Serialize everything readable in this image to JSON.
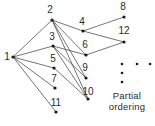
{
  "figure": {
    "caption": "Partial\nordering",
    "caption_x": 127,
    "caption_y": 90,
    "edge_color": "#3a3a3a",
    "node_color": "#1a1a1a",
    "label_color": "#2a2a2a",
    "background": "#ffffff"
  },
  "chart_data": {
    "type": "diagram",
    "title": "Partial ordering",
    "layout": "directed-acyclic-graph",
    "nodes": [
      {
        "id": "1",
        "label": "1",
        "x": 13,
        "y": 57,
        "label_x": 7,
        "label_y": 57
      },
      {
        "id": "2",
        "label": "2",
        "x": 52,
        "y": 20,
        "label_x": 50,
        "label_y": 10
      },
      {
        "id": "3",
        "label": "3",
        "x": 53,
        "y": 46,
        "label_x": 52,
        "label_y": 37
      },
      {
        "id": "4",
        "label": "4",
        "x": 83,
        "y": 31,
        "label_x": 82,
        "label_y": 22
      },
      {
        "id": "5",
        "label": "5",
        "x": 54,
        "y": 68,
        "label_x": 53,
        "label_y": 59
      },
      {
        "id": "6",
        "label": "6",
        "x": 86,
        "y": 55,
        "label_x": 85,
        "label_y": 45
      },
      {
        "id": "7",
        "label": "7",
        "x": 55,
        "y": 88,
        "label_x": 54,
        "label_y": 79
      },
      {
        "id": "8",
        "label": "8",
        "x": 124,
        "y": 17,
        "label_x": 123,
        "label_y": 7
      },
      {
        "id": "9",
        "label": "9",
        "x": 86,
        "y": 78,
        "label_x": 85,
        "label_y": 68
      },
      {
        "id": "10",
        "label": "10",
        "x": 88,
        "y": 99,
        "label_x": 88,
        "label_y": 92
      },
      {
        "id": "11",
        "label": "11",
        "x": 56,
        "y": 112,
        "label_x": 56,
        "label_y": 103
      },
      {
        "id": "12",
        "label": "12",
        "x": 124,
        "y": 42,
        "label_x": 124,
        "label_y": 31
      }
    ],
    "edges": [
      {
        "from": "1",
        "to": "2"
      },
      {
        "from": "1",
        "to": "3"
      },
      {
        "from": "1",
        "to": "5"
      },
      {
        "from": "1",
        "to": "7"
      },
      {
        "from": "1",
        "to": "11"
      },
      {
        "from": "2",
        "to": "4"
      },
      {
        "from": "2",
        "to": "6"
      },
      {
        "from": "2",
        "to": "9"
      },
      {
        "from": "2",
        "to": "10"
      },
      {
        "from": "3",
        "to": "6"
      },
      {
        "from": "3",
        "to": "9"
      },
      {
        "from": "3",
        "to": "10"
      },
      {
        "from": "4",
        "to": "8"
      },
      {
        "from": "4",
        "to": "12"
      },
      {
        "from": "6",
        "to": "12"
      },
      {
        "from": "5",
        "to": "10"
      }
    ],
    "ellipsis_dots": [
      {
        "x": 122,
        "y": 64
      },
      {
        "x": 137,
        "y": 64
      },
      {
        "x": 150,
        "y": 64
      },
      {
        "x": 122,
        "y": 73
      },
      {
        "x": 122,
        "y": 82
      }
    ]
  }
}
